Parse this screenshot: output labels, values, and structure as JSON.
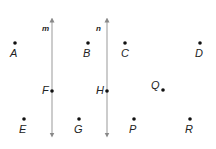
{
  "diagram": {
    "lines": [
      {
        "label": "m",
        "x": 52,
        "y1": 20,
        "y2": 135
      },
      {
        "label": "n",
        "x": 107,
        "y1": 20,
        "y2": 135
      }
    ],
    "points": [
      {
        "label": "A",
        "x": 15,
        "y": 43
      },
      {
        "label": "B",
        "x": 88,
        "y": 43
      },
      {
        "label": "C",
        "x": 125,
        "y": 43
      },
      {
        "label": "D",
        "x": 200,
        "y": 43
      },
      {
        "label": "F",
        "x": 52,
        "y": 91
      },
      {
        "label": "H",
        "x": 107,
        "y": 91
      },
      {
        "label": "Q",
        "x": 163,
        "y": 90
      },
      {
        "label": "E",
        "x": 24,
        "y": 119
      },
      {
        "label": "G",
        "x": 79,
        "y": 119
      },
      {
        "label": "P",
        "x": 134,
        "y": 119
      },
      {
        "label": "R",
        "x": 190,
        "y": 119
      }
    ]
  }
}
